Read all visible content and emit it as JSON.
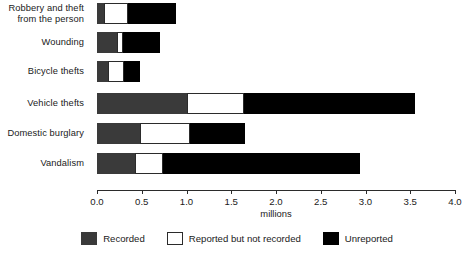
{
  "chart_data": {
    "type": "bar",
    "orientation": "horizontal",
    "stacked": true,
    "title": "",
    "xlabel": "millions",
    "ylabel": "",
    "xlim": [
      0.0,
      4.0
    ],
    "grid": false,
    "legend_position": "bottom",
    "categories": [
      "Robbery and theft\nfrom the person",
      "Wounding",
      "Bicycle thefts",
      "Vehicle thefts",
      "Domestic burglary",
      "Vandalism"
    ],
    "tick_labels": [
      "0.0",
      "0.5",
      "1.0",
      "1.5",
      "2.0",
      "2.5",
      "3.0",
      "3.5",
      "4.0"
    ],
    "tick_values": [
      0.0,
      0.5,
      1.0,
      1.5,
      2.0,
      2.5,
      3.0,
      3.5,
      4.0
    ],
    "series": [
      {
        "name": "Recorded",
        "color": "#3a3a3a",
        "values": [
          0.08,
          0.22,
          0.12,
          1.0,
          0.48,
          0.42
        ]
      },
      {
        "name": "Reported but not recorded",
        "color": "#ffffff",
        "values": [
          0.27,
          0.07,
          0.18,
          0.64,
          0.56,
          0.32
        ]
      },
      {
        "name": "Unreported",
        "color": "#000000",
        "values": [
          0.53,
          0.41,
          0.18,
          1.91,
          0.61,
          2.2
        ]
      }
    ],
    "totals": [
      0.88,
      0.7,
      0.48,
      3.55,
      1.65,
      2.94
    ]
  }
}
